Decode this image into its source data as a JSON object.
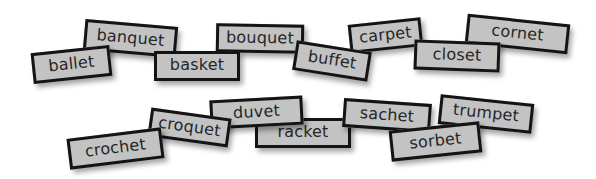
{
  "activity": {
    "cards": [
      {
        "word": "banquet",
        "cx": 130,
        "cy": 38,
        "w": 93,
        "h": 31,
        "rot": 5,
        "z": 1
      },
      {
        "word": "ballet",
        "cx": 71,
        "cy": 64,
        "w": 79,
        "h": 31,
        "rot": -6,
        "z": 2
      },
      {
        "word": "basket",
        "cx": 197,
        "cy": 66,
        "w": 86,
        "h": 30,
        "rot": 0,
        "z": 2
      },
      {
        "word": "bouquet",
        "cx": 260,
        "cy": 38,
        "w": 88,
        "h": 29,
        "rot": 1,
        "z": 1
      },
      {
        "word": "buffet",
        "cx": 332,
        "cy": 61,
        "w": 76,
        "h": 30,
        "rot": 9,
        "z": 2
      },
      {
        "word": "carpet",
        "cx": 385,
        "cy": 35,
        "w": 73,
        "h": 29,
        "rot": -6,
        "z": 1
      },
      {
        "word": "cornet",
        "cx": 517,
        "cy": 34,
        "w": 103,
        "h": 30,
        "rot": 6,
        "z": 1
      },
      {
        "word": "closet",
        "cx": 457,
        "cy": 56,
        "w": 86,
        "h": 30,
        "rot": 2,
        "z": 2
      },
      {
        "word": "racket",
        "cx": 303,
        "cy": 133,
        "w": 96,
        "h": 30,
        "rot": 0,
        "z": 1
      },
      {
        "word": "duvet",
        "cx": 256,
        "cy": 112,
        "w": 93,
        "h": 29,
        "rot": -3,
        "z": 2
      },
      {
        "word": "croquet",
        "cx": 189,
        "cy": 127,
        "w": 81,
        "h": 29,
        "rot": 8,
        "z": 3
      },
      {
        "word": "crochet",
        "cx": 115,
        "cy": 148,
        "w": 95,
        "h": 31,
        "rot": -7,
        "z": 4
      },
      {
        "word": "sachet",
        "cx": 387,
        "cy": 115,
        "w": 88,
        "h": 29,
        "rot": 4,
        "z": 2
      },
      {
        "word": "trumpet",
        "cx": 486,
        "cy": 114,
        "w": 94,
        "h": 30,
        "rot": 6,
        "z": 2
      },
      {
        "word": "sorbet",
        "cx": 435,
        "cy": 141,
        "w": 91,
        "h": 31,
        "rot": -6,
        "z": 3
      }
    ]
  }
}
